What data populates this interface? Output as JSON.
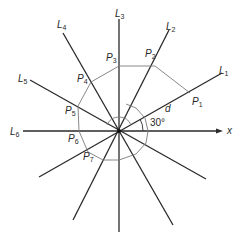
{
  "diagram": {
    "lines": [
      {
        "name": "L",
        "sub": "1",
        "angle_deg": 30
      },
      {
        "name": "L",
        "sub": "2",
        "angle_deg": 60
      },
      {
        "name": "L",
        "sub": "3",
        "angle_deg": 90
      },
      {
        "name": "L",
        "sub": "4",
        "angle_deg": 120
      },
      {
        "name": "L",
        "sub": "5",
        "angle_deg": 150
      },
      {
        "name": "L",
        "sub": "6",
        "angle_deg": 180
      }
    ],
    "points": [
      {
        "name": "P",
        "sub": "1"
      },
      {
        "name": "P",
        "sub": "2"
      },
      {
        "name": "P",
        "sub": "3"
      },
      {
        "name": "P",
        "sub": "4"
      },
      {
        "name": "P",
        "sub": "5"
      },
      {
        "name": "P",
        "sub": "6"
      },
      {
        "name": "P",
        "sub": "7"
      }
    ],
    "axis_label": "x",
    "distance_label": "d",
    "angle_label": "30°"
  }
}
